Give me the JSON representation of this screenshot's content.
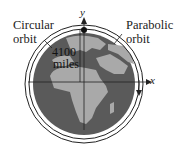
{
  "diagram": {
    "labels": {
      "circular_orbit_line1": "Circular",
      "circular_orbit_line2": "orbit",
      "parabolic_orbit_line1": "Parabolic",
      "parabolic_orbit_line2": "orbit",
      "distance_value": "4100",
      "distance_unit": "miles",
      "x_axis": "x",
      "y_axis": "y"
    },
    "colors": {
      "ocean": "#5a5a5a",
      "land": "#a9a9a9",
      "orbit_line": "#222222",
      "background": "#ffffff"
    }
  }
}
